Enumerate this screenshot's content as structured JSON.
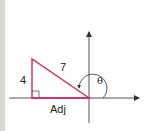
{
  "diagram": {
    "type": "right-triangle-on-axes",
    "labels": {
      "opposite": "4",
      "hypotenuse": "7",
      "adjacent": "Adj",
      "angle": "θ"
    },
    "colors": {
      "triangle": "#d6336c",
      "axes": "#555555",
      "border": "#d9d9cf"
    }
  }
}
